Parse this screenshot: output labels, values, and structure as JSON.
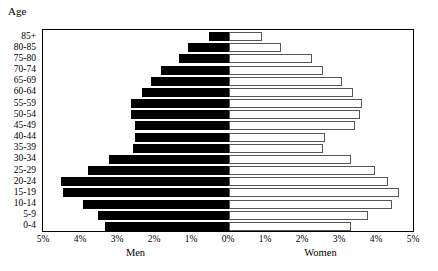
{
  "chart_data": {
    "type": "bar",
    "subtype": "population-pyramid",
    "title": "",
    "corner_label": "Age",
    "ylabel": "Age",
    "xlabel": "",
    "grid": false,
    "legend": "none",
    "axis_label_men": "Men",
    "axis_label_women": "Women",
    "categories": [
      "85+",
      "80-85",
      "75-80",
      "70-74",
      "65-69",
      "60-64",
      "55-59",
      "50-54",
      "45-49",
      "40-44",
      "35-39",
      "30-34",
      "25-29",
      "20-24",
      "15-19",
      "10-14",
      "5-9",
      "0-4"
    ],
    "xlim": [
      -5,
      5
    ],
    "xtick_values": [
      -5,
      -4,
      -3,
      -2,
      -1,
      0,
      1,
      2,
      3,
      4,
      5
    ],
    "xtick_labels": [
      "5%",
      "4%",
      "3%",
      "2%",
      "1%",
      "0%",
      "1%",
      "2%",
      "3%",
      "4%",
      "5%"
    ],
    "units": "percent of total population",
    "series": [
      {
        "name": "Men",
        "side": "left",
        "color": "#000000",
        "values": [
          0.55,
          1.1,
          1.35,
          1.85,
          2.1,
          2.35,
          2.65,
          2.65,
          2.55,
          2.55,
          2.6,
          3.25,
          3.8,
          4.55,
          4.5,
          3.95,
          3.55,
          3.35
        ]
      },
      {
        "name": "Women",
        "side": "right",
        "color": "#ffffff",
        "values": [
          0.9,
          1.4,
          2.25,
          2.55,
          3.05,
          3.35,
          3.6,
          3.55,
          3.4,
          2.6,
          2.55,
          3.3,
          3.95,
          4.3,
          4.6,
          4.4,
          3.75,
          3.3
        ]
      }
    ]
  },
  "colors": {
    "men_fill": "#000000",
    "women_fill": "#ffffff",
    "bar_outline": "#555555",
    "frame": "#000000",
    "background": "#ffffff",
    "text": "#000000"
  }
}
